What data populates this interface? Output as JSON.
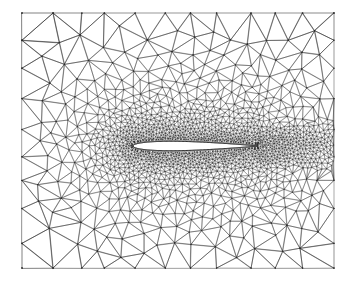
{
  "figure": {
    "kind": "unstructured-triangular-mesh",
    "caption": "Computational fluid dynamics grid: Delaunay triangulation with strong refinement clustered around the airfoil surface and wake, coarsening toward the rectangular far-field boundary.",
    "background_color": "#ffffff",
    "edge_color": "#2b2b2b",
    "body_fill_color": "#ffffff",
    "body_outline_color": "#000000"
  },
  "canvas": {
    "width": 355,
    "height": 288
  },
  "mesh_domain": {
    "x_min": 22,
    "y_min": 13,
    "x_max": 334,
    "y_max": 268,
    "shape": "rectangle"
  },
  "airfoil": {
    "name": "NACA-0012-like symmetric section",
    "leading_edge_x": 133,
    "trailing_edge_x": 258,
    "chord_length": 125,
    "center_y": 146,
    "max_thickness": 9.5,
    "angle_of_attack_deg": 0,
    "surface_points": 140
  },
  "refinement": {
    "description": "Element size driven by distance from the airfoil surface plus a downstream wake band",
    "min_edge_length_px": 2.0,
    "max_edge_length_px": 30.0,
    "near_body_spacing_px": 2.0,
    "far_field_spacing_px": 30.0,
    "growth_exponent": 1.35,
    "wake_half_width_px": 34,
    "wake_length_px": 110,
    "near_field_halo_px": 150,
    "approx_node_count": 5200,
    "approx_triangle_count": 10200
  },
  "style": {
    "edge_width_near_px": 0.35,
    "edge_width_far_px": 0.6,
    "node_dot_radius_px": 0.9,
    "draw_node_dots": true,
    "antialias": true
  },
  "seed": 20240917
}
